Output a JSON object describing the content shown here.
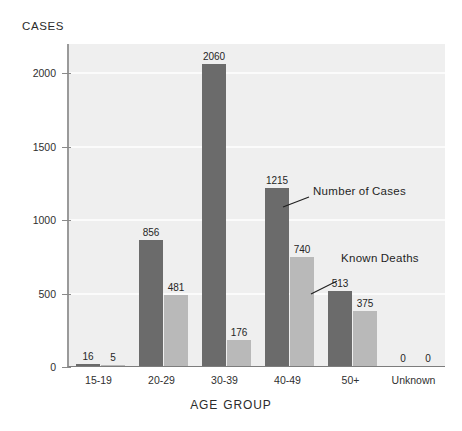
{
  "chart_data": {
    "type": "bar",
    "title": "",
    "xlabel": "AGE GROUP",
    "ylabel": "CASES",
    "categories": [
      "15-19",
      "20-29",
      "30-39",
      "40-49",
      "50+",
      "Unknown"
    ],
    "series": [
      {
        "name": "Number of Cases",
        "color": "#6b6b6b",
        "values": [
          16,
          856,
          2060,
          1215,
          513,
          0
        ]
      },
      {
        "name": "Known Deaths",
        "color": "#b9b9b9",
        "values": [
          5,
          481,
          176,
          740,
          375,
          0
        ]
      }
    ],
    "ylim": [
      0,
      2200
    ],
    "yticks": [
      0,
      500,
      1000,
      1500,
      2000
    ],
    "ytick_labels": [
      "0",
      "500",
      "1000",
      "1500",
      "2000"
    ],
    "grid": true,
    "legend": "annotations-with-leader-lines",
    "annotations": [
      {
        "text": "Number of Cases",
        "points_to": "40-49 cases bar"
      },
      {
        "text": "Known Deaths",
        "points_to": "40-49 deaths bar"
      }
    ],
    "background": "#efefef"
  },
  "axis": {
    "y_title": "CASES",
    "x_title_part1": "AGE",
    "x_title_part2": "GROUP"
  },
  "annotations": {
    "cases_part1": "Number",
    "cases_part2": "of",
    "cases_part3": "Cases",
    "deaths_part1": "Known",
    "deaths_part2": "Deaths"
  }
}
